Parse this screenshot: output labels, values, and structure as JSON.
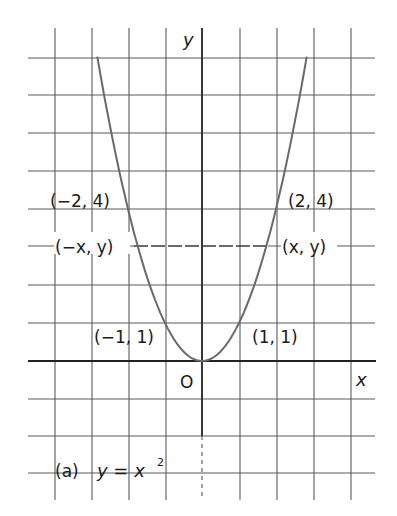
{
  "chart_data": {
    "type": "line",
    "caption_prefix": "(a)",
    "caption_equation": "y = x",
    "caption_exponent": "2",
    "xlabel": "x",
    "ylabel": "y",
    "origin_label": "O",
    "xlim": [
      -4,
      4
    ],
    "ylim": [
      -3,
      8
    ],
    "grid": true,
    "series": [
      {
        "name": "y = x^2",
        "x": [
          -2.83,
          -2.5,
          -2,
          -1.5,
          -1,
          -0.5,
          0,
          0.5,
          1,
          1.5,
          2,
          2.5,
          2.83
        ],
        "values": [
          8,
          6.25,
          4,
          2.25,
          1,
          0.25,
          0,
          0.25,
          1,
          2.25,
          4,
          6.25,
          8
        ]
      }
    ],
    "annotations": [
      {
        "text": "(−2, 4)",
        "x": -2,
        "y": 4
      },
      {
        "text": "(2, 4)",
        "x": 2,
        "y": 4
      },
      {
        "text": "(−x, y)",
        "x": -1.73,
        "y": 3
      },
      {
        "text": "(x, y)",
        "x": 1.73,
        "y": 3
      },
      {
        "text": "(−1, 1)",
        "x": -1,
        "y": 1
      },
      {
        "text": "(1, 1)",
        "x": 1,
        "y": 1
      }
    ],
    "dashed_line": {
      "from": "(−x, y)",
      "to": "(x, y)",
      "y": 3
    }
  },
  "labels": {
    "y_axis": "y",
    "x_axis": "x",
    "origin": "O",
    "p_neg2_4": "(−2, 4)",
    "p_2_4": "(2, 4)",
    "p_negx_y": "(−x, y)",
    "p_x_y": "(x, y)",
    "p_neg1_1": "(−1, 1)",
    "p_1_1": "(1, 1)",
    "caption_prefix": "(a)",
    "caption_eq": "y = x",
    "caption_exp": "2"
  }
}
